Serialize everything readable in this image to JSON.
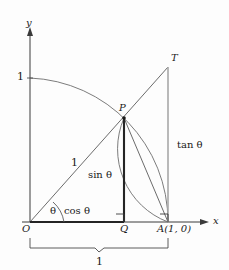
{
  "figure": {
    "colors": {
      "background": "#fdfdfd",
      "stroke_dark": "#2b2b2b",
      "stroke_mid": "#555555",
      "stroke_light": "#9a9a9a",
      "text": "#1a1a1a"
    }
  },
  "axes": {
    "y_label": "y",
    "x_label": "x",
    "origin_label": "O",
    "y_unit_label": "1"
  },
  "points": {
    "P": "P",
    "Q": "Q",
    "T": "T",
    "A": "A(1, 0)"
  },
  "segments": {
    "radius_label": "1",
    "sin_label": "sin θ",
    "cos_label": "cos θ",
    "tan_label": "tan θ",
    "angle_label": "θ",
    "brace_label": "1"
  },
  "geometry": {
    "origin": [
      30,
      222
    ],
    "A": [
      168,
      222
    ],
    "Q": [
      124,
      222
    ],
    "P": [
      124,
      118
    ],
    "T": [
      168,
      67
    ],
    "y_top": [
      30,
      30
    ],
    "x_right": [
      208,
      222
    ],
    "unit_on_y": [
      30,
      78
    ],
    "radius": 144
  }
}
